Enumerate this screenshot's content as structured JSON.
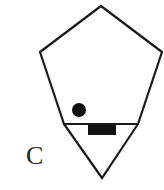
{
  "figure": {
    "label": "C",
    "stroke_color": "#1a1a1a",
    "fill_color": "#111111",
    "shapes": {
      "pentagon_points": "101,6 162,52 138,124 64,124 40,52",
      "triangle_points": "64,124 138,124 102,178",
      "divider_line": {
        "x1": 64,
        "y1": 124,
        "x2": 138,
        "y2": 124
      },
      "dot": {
        "cx": 79,
        "cy": 110,
        "r": 7
      },
      "rect": {
        "x": 88,
        "y": 125,
        "width": 28,
        "height": 10
      }
    }
  }
}
